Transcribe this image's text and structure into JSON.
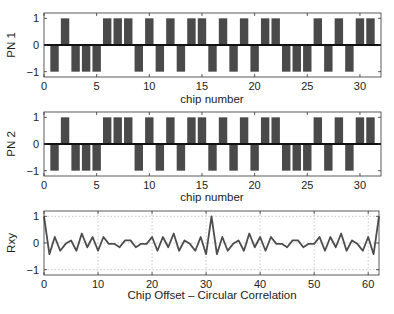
{
  "chart_data": [
    {
      "type": "bar",
      "title": "",
      "xlabel": "chip number",
      "ylabel": "PN 1",
      "xlim": [
        0,
        32
      ],
      "ylim": [
        -1.2,
        1.2
      ],
      "xticks": [
        0,
        5,
        10,
        15,
        20,
        25,
        30
      ],
      "yticks": [
        -1,
        0,
        1
      ],
      "grid": false,
      "x": [
        1,
        2,
        3,
        4,
        5,
        6,
        7,
        8,
        9,
        10,
        11,
        12,
        13,
        14,
        15,
        16,
        17,
        18,
        19,
        20,
        21,
        22,
        23,
        24,
        25,
        26,
        27,
        28,
        29,
        30,
        31
      ],
      "values": [
        -1,
        1,
        -1,
        -1,
        -1,
        1,
        1,
        1,
        -1,
        1,
        -1,
        1,
        -1,
        1,
        1,
        -1,
        1,
        -1,
        1,
        -1,
        1,
        1,
        -1,
        -1,
        -1,
        1,
        -1,
        1,
        -1,
        1,
        1
      ]
    },
    {
      "type": "bar",
      "title": "",
      "xlabel": "chip number",
      "ylabel": "PN 2",
      "xlim": [
        0,
        32
      ],
      "ylim": [
        -1.2,
        1.2
      ],
      "xticks": [
        0,
        5,
        10,
        15,
        20,
        25,
        30
      ],
      "yticks": [
        -1,
        0,
        1
      ],
      "grid": false,
      "x": [
        1,
        2,
        3,
        4,
        5,
        6,
        7,
        8,
        9,
        10,
        11,
        12,
        13,
        14,
        15,
        16,
        17,
        18,
        19,
        20,
        21,
        22,
        23,
        24,
        25,
        26,
        27,
        28,
        29,
        30,
        31
      ],
      "values": [
        -1,
        1,
        -1,
        -1,
        -1,
        1,
        1,
        1,
        -1,
        1,
        -1,
        1,
        -1,
        1,
        1,
        -1,
        1,
        -1,
        1,
        -1,
        1,
        1,
        -1,
        -1,
        -1,
        1,
        -1,
        1,
        -1,
        1,
        1
      ]
    },
    {
      "type": "line",
      "title": "",
      "xlabel": "Chip Offset – Circular Correlation",
      "ylabel": "Rxy",
      "xlim": [
        0,
        62
      ],
      "ylim": [
        -1.2,
        1.2
      ],
      "xticks": [
        0,
        10,
        20,
        30,
        40,
        50,
        60
      ],
      "yticks": [
        -1,
        0,
        1
      ],
      "grid": true,
      "x": [
        0,
        1,
        2,
        3,
        4,
        5,
        6,
        7,
        8,
        9,
        10,
        11,
        12,
        13,
        14,
        15,
        16,
        17,
        18,
        19,
        20,
        21,
        22,
        23,
        24,
        25,
        26,
        27,
        28,
        29,
        30,
        31,
        32,
        33,
        34,
        35,
        36,
        37,
        38,
        39,
        40,
        41,
        42,
        43,
        44,
        45,
        46,
        47,
        48,
        49,
        50,
        51,
        52,
        53,
        54,
        55,
        56,
        57,
        58,
        59,
        60,
        61,
        62
      ],
      "values": [
        1.0,
        -0.419,
        0.226,
        -0.29,
        -0.032,
        0.097,
        -0.29,
        0.355,
        -0.161,
        0.226,
        -0.29,
        0.226,
        -0.032,
        -0.032,
        -0.161,
        0.097,
        0.097,
        -0.161,
        -0.032,
        -0.032,
        0.226,
        -0.29,
        0.226,
        -0.161,
        0.355,
        -0.29,
        0.097,
        -0.032,
        -0.29,
        0.226,
        -0.419,
        1.0,
        -0.419,
        0.226,
        -0.29,
        -0.032,
        0.097,
        -0.29,
        0.355,
        -0.161,
        0.226,
        -0.29,
        0.226,
        -0.032,
        -0.032,
        -0.161,
        0.097,
        0.097,
        -0.161,
        -0.032,
        -0.032,
        0.226,
        -0.29,
        0.226,
        -0.161,
        0.355,
        -0.29,
        0.097,
        -0.032,
        -0.29,
        0.226,
        -0.419,
        1.0
      ]
    }
  ],
  "plots": {
    "pn1": {
      "ylabel": "PN 1",
      "xlabel": "chip number"
    },
    "pn2": {
      "ylabel": "PN 2",
      "xlabel": "chip number"
    },
    "corr": {
      "ylabel": "Rxy",
      "xlabel": "Chip Offset – Circular Correlation"
    }
  },
  "colors": {
    "bar_fill": "#4a4a4a",
    "line": "#4d4d4d",
    "axis": "#333333",
    "grid": "#bdbdbd",
    "zero_line": "#111111"
  }
}
